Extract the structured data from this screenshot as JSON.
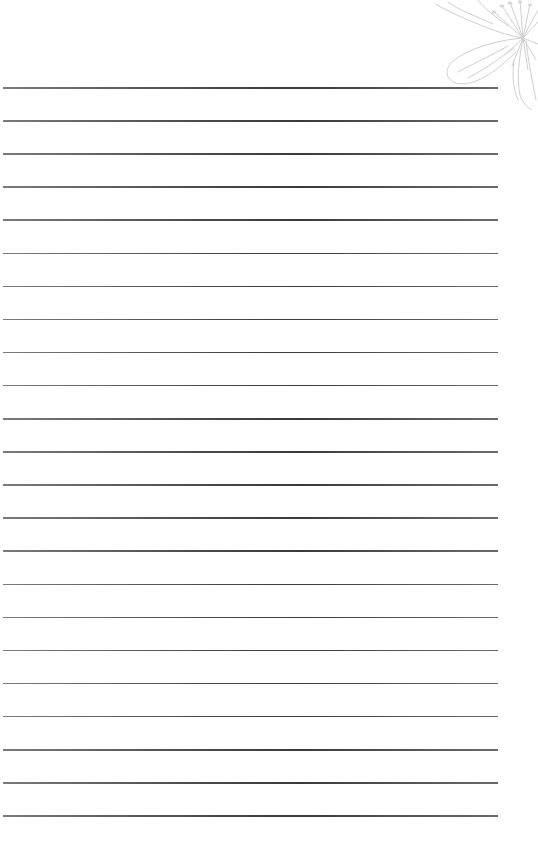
{
  "page": {
    "type": "lined-paper",
    "background": "#ffffff",
    "line_color": "#555555",
    "line_count": 23,
    "first_line_y": 87,
    "line_spacing": 33.1,
    "line_left": 3,
    "line_right": 498
  },
  "decoration": {
    "icon": "flower-line-art-icon",
    "position": "top-right",
    "color": "#cfcfcf"
  }
}
